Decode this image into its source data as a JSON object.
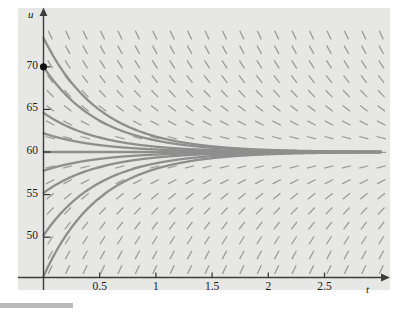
{
  "figure": {
    "axis_labels": {
      "x": "t",
      "y": "u"
    },
    "background_color": "#e7e7e5",
    "axis_color": "#3c3c3c",
    "curve_color": "#8e8e8e",
    "field_color": "#9a9a9a",
    "marker_color": "#111111"
  },
  "chart_data": {
    "type": "line",
    "title": "",
    "xlabel": "t",
    "ylabel": "u",
    "xlim": [
      -0.05,
      3.0
    ],
    "ylim": [
      45.2,
      73.5
    ],
    "grid": false,
    "legend": false,
    "xticks": [
      0.5,
      1,
      1.5,
      2,
      2.5
    ],
    "xticklabels": [
      "0.5",
      "1",
      "1.5",
      "2",
      "2.5"
    ],
    "yticks": [
      50,
      55,
      60,
      65,
      70
    ],
    "yticklabels": [
      "50",
      "55",
      "60",
      "65",
      "70"
    ],
    "equilibrium": 60,
    "annotations": [
      {
        "name": "initial-condition-point",
        "x": 0,
        "y": 70,
        "label": ""
      }
    ],
    "direction_field": {
      "description": "slope marks of du/dt = -k (u - 60)",
      "k": 2.0,
      "x_start": 0.06,
      "x_step": 0.155,
      "y_start": 46.2,
      "y_step": 1.72,
      "dash_length": 9.5
    },
    "series": [
      {
        "name": "solution-u0-73.4",
        "u0": 73.4,
        "k": 2.0
      },
      {
        "name": "solution-u0-70",
        "u0": 70,
        "k": 2.0
      },
      {
        "name": "solution-u0-64.6",
        "u0": 64.6,
        "k": 2.0
      },
      {
        "name": "solution-u0-62.2",
        "u0": 62.2,
        "k": 2.0
      },
      {
        "name": "solution-u0-60",
        "u0": 60,
        "k": 2.0
      },
      {
        "name": "solution-u0-57.8",
        "u0": 57.8,
        "k": 2.0
      },
      {
        "name": "solution-u0-55.2",
        "u0": 55.2,
        "k": 2.0
      },
      {
        "name": "solution-u0-50.2",
        "u0": 50.2,
        "k": 2.0
      },
      {
        "name": "solution-u0-45.4",
        "u0": 45.4,
        "k": 2.0
      }
    ]
  },
  "tick_labels": {
    "x": [
      "0.5",
      "1",
      "1.5",
      "2",
      "2.5"
    ],
    "y": [
      "70",
      "65",
      "60",
      "55",
      "50"
    ]
  }
}
